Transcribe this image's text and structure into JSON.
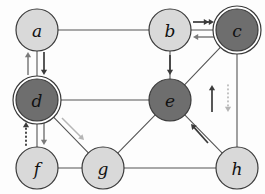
{
  "figure": {
    "name": "directed-graph-diagram",
    "background": "#fdfdfd",
    "width": 265,
    "height": 194
  },
  "style": {
    "node_fill_light": "#d9d9d9",
    "node_fill_dark": "#6e6e6e",
    "node_stroke": "#3a3a3a",
    "edge_color": "#555555",
    "arrow_dark": "#3a3a3a",
    "arrow_mid": "#7a7a7a",
    "arrow_light": "#b5b5b5",
    "node_radius": 21,
    "double_ring_gap": 3
  },
  "chart_data": {
    "type": "diagram",
    "title": "",
    "nodes": [
      {
        "id": "a",
        "label": "a",
        "x": 37,
        "y": 30,
        "shade": "light",
        "ring": "single"
      },
      {
        "id": "b",
        "label": "b",
        "x": 170,
        "y": 30,
        "shade": "light",
        "ring": "single"
      },
      {
        "id": "c",
        "label": "c",
        "x": 237,
        "y": 30,
        "shade": "dark",
        "ring": "double"
      },
      {
        "id": "d",
        "label": "d",
        "x": 37,
        "y": 100,
        "shade": "dark",
        "ring": "double"
      },
      {
        "id": "e",
        "label": "e",
        "x": 170,
        "y": 100,
        "shade": "dark",
        "ring": "single"
      },
      {
        "id": "f",
        "label": "f",
        "x": 37,
        "y": 168,
        "shade": "light",
        "ring": "single"
      },
      {
        "id": "g",
        "label": "g",
        "x": 103,
        "y": 168,
        "shade": "light",
        "ring": "single"
      },
      {
        "id": "h",
        "label": "h",
        "x": 237,
        "y": 168,
        "shade": "light",
        "ring": "single"
      }
    ],
    "edges": [
      {
        "from": "a",
        "to": "b"
      },
      {
        "from": "a",
        "to": "d"
      },
      {
        "from": "b",
        "to": "c"
      },
      {
        "from": "b",
        "to": "e"
      },
      {
        "from": "c",
        "to": "e"
      },
      {
        "from": "c",
        "to": "h"
      },
      {
        "from": "d",
        "to": "e"
      },
      {
        "from": "d",
        "to": "f"
      },
      {
        "from": "d",
        "to": "g"
      },
      {
        "from": "e",
        "to": "g"
      },
      {
        "from": "e",
        "to": "h"
      },
      {
        "from": "f",
        "to": "g"
      },
      {
        "from": "g",
        "to": "h"
      }
    ],
    "arrows": [
      {
        "id": "arrow-d-to-a",
        "from": "d",
        "to": "a",
        "direction": "up",
        "line": "solid",
        "head": "single",
        "tone": "mid",
        "x1": 28,
        "y1": 75,
        "x2": 28,
        "y2": 52
      },
      {
        "id": "arrow-a-to-d",
        "from": "a",
        "to": "d",
        "direction": "down",
        "line": "solid",
        "head": "single",
        "tone": "dark",
        "x1": 44,
        "y1": 52,
        "x2": 44,
        "y2": 75
      },
      {
        "id": "arrow-b-to-c",
        "from": "b",
        "to": "c",
        "direction": "right",
        "line": "solid",
        "head": "double",
        "tone": "dark",
        "x1": 193,
        "y1": 22,
        "x2": 214,
        "y2": 22
      },
      {
        "id": "arrow-c-to-b",
        "from": "c",
        "to": "b",
        "direction": "left",
        "line": "solid",
        "head": "single",
        "tone": "mid",
        "x1": 214,
        "y1": 37,
        "x2": 193,
        "y2": 37
      },
      {
        "id": "arrow-b-to-e",
        "from": "b",
        "to": "e",
        "direction": "down",
        "line": "solid",
        "head": "single",
        "tone": "dark",
        "x1": 170,
        "y1": 55,
        "x2": 170,
        "y2": 75
      },
      {
        "id": "arrow-f-to-d",
        "from": "f",
        "to": "d",
        "direction": "up",
        "line": "dotted",
        "head": "single",
        "tone": "dark",
        "x1": 26,
        "y1": 145,
        "x2": 26,
        "y2": 122
      },
      {
        "id": "arrow-d-to-f",
        "from": "d",
        "to": "f",
        "direction": "down",
        "line": "solid",
        "head": "single",
        "tone": "mid",
        "x1": 44,
        "y1": 122,
        "x2": 44,
        "y2": 145
      },
      {
        "id": "arrow-d-to-g",
        "from": "d",
        "to": "g",
        "direction": "down-right",
        "line": "solid",
        "head": "single",
        "tone": "light",
        "x1": 62,
        "y1": 118,
        "x2": 84,
        "y2": 140
      },
      {
        "id": "arrow-h-to-e",
        "from": "h",
        "to": "e",
        "direction": "up-left",
        "line": "solid",
        "head": "single",
        "tone": "dark",
        "x1": 208,
        "y1": 143,
        "x2": 191,
        "y2": 124
      },
      {
        "id": "arrow-h-to-c",
        "from": "h",
        "to": "c",
        "direction": "up",
        "line": "solid",
        "head": "single",
        "tone": "dark",
        "x1": 212,
        "y1": 112,
        "x2": 212,
        "y2": 85
      },
      {
        "id": "arrow-c-to-h",
        "from": "c",
        "to": "h",
        "direction": "down",
        "line": "dotted",
        "head": "single",
        "tone": "light",
        "x1": 228,
        "y1": 85,
        "x2": 228,
        "y2": 112
      }
    ],
    "legend": [],
    "annotations": []
  }
}
